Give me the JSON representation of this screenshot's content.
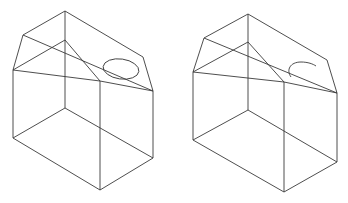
{
  "diagram": {
    "figures": [
      {
        "id": "left",
        "hole": "full-ellipse"
      },
      {
        "id": "right",
        "hole": "half-ellipse"
      }
    ],
    "line_color": "#3a3a3a",
    "background": "#ffffff"
  }
}
